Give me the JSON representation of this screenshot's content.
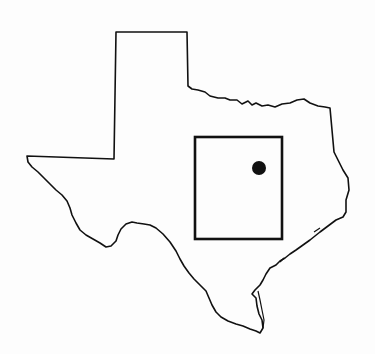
{
  "map": {
    "region": "Texas",
    "outline_color": "#111111",
    "background": "#fdfdfd",
    "study_area": {
      "x": 195,
      "y": 137,
      "width": 87,
      "height": 102
    },
    "marker": {
      "cx": 259,
      "cy": 168,
      "r": 7,
      "color": "#111111"
    }
  }
}
